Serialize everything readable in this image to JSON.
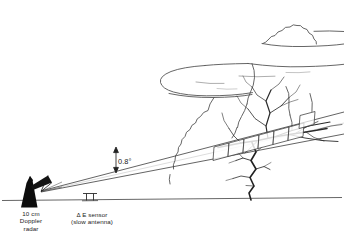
{
  "diagram": {
    "background_color": "#ffffff",
    "line_color": "#3a3a3a",
    "ink_color": "#111111",
    "labels": {
      "radar": "10 cm\nDoppler\nradar",
      "sensor": "Δ E sensor\n(slow antenna)",
      "beam_angle": "0.8°"
    },
    "elements": {
      "radar_icon": "radar-tower-icon",
      "sensor_icon": "slow-antenna-icon",
      "ground_icon": "ground-line",
      "cloud_icon": "anvil-cloud-icon",
      "lightning_icon": "lightning-channel-icon",
      "beam_icon": "radar-beam-icon",
      "gates_icon": "range-gate-boxes-icon",
      "angle_arrow_icon": "double-arrow-icon"
    }
  }
}
